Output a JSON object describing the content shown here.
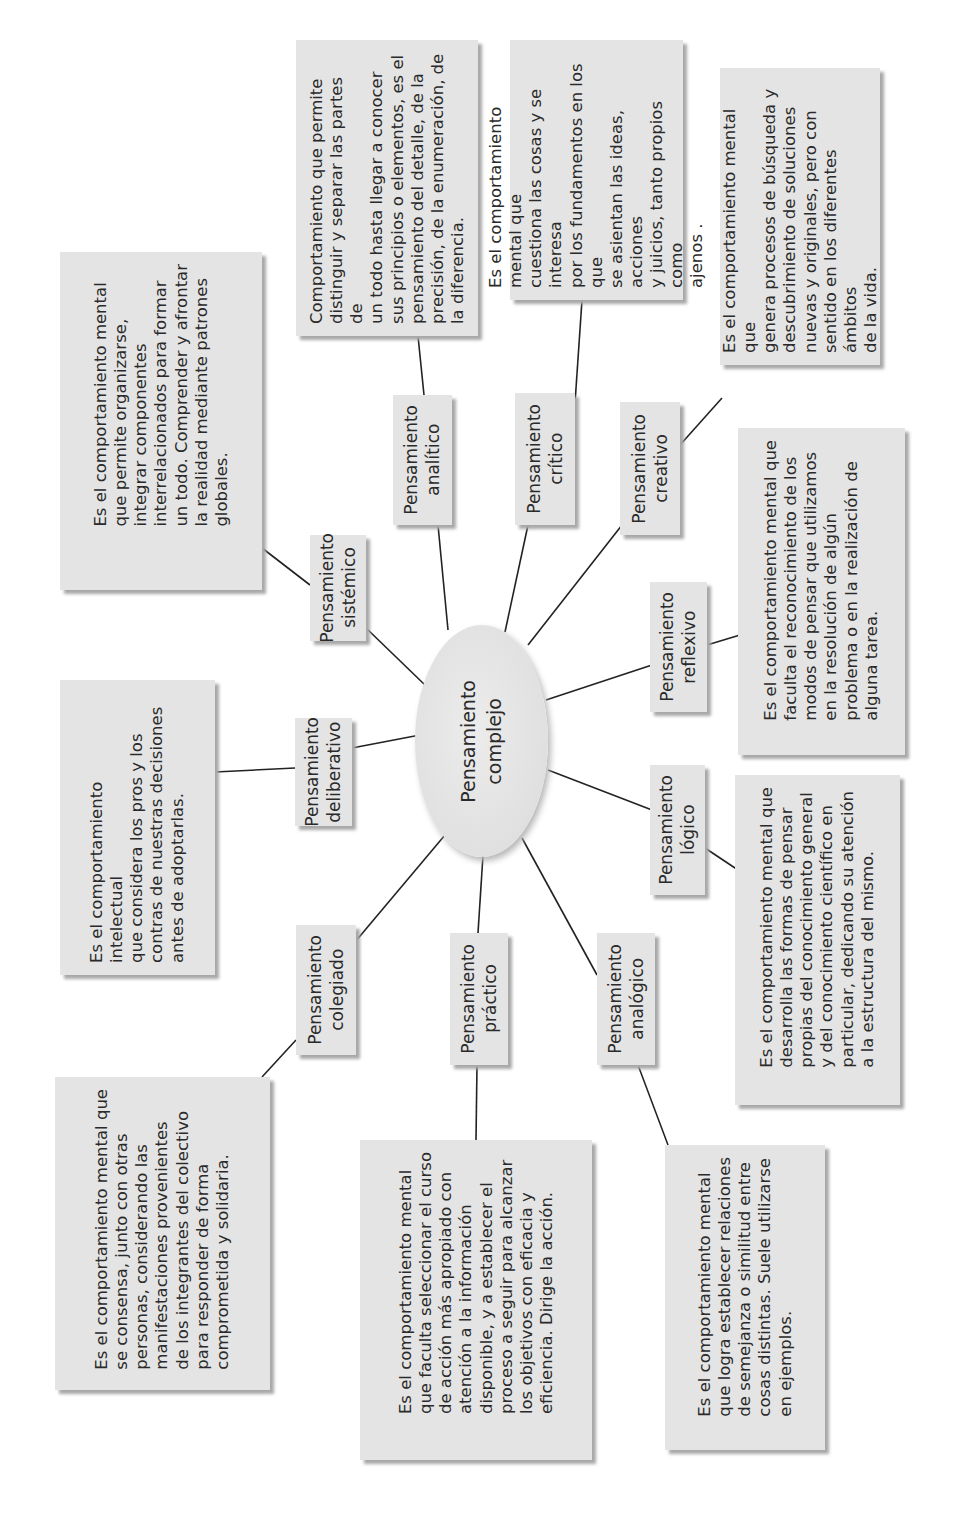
{
  "center": {
    "label": "Pensamiento\ncomplejo"
  },
  "colors": {
    "box_fill": "#e4e4e4",
    "shadow": "#a8a8a8",
    "line": "#222222",
    "text": "#2a2a2a"
  },
  "nodes": [
    {
      "id": "sistemico",
      "label": "Pensamiento\nsistémico",
      "definition": "Es el comportamiento mental\nque permite organizarse,\nintegrar componentes\ninterrelacionados para formar\nun todo. Comprender y afrontar\nla realidad mediante patrones\nglobales."
    },
    {
      "id": "analitico",
      "label": "Pensamiento\nanalítico",
      "definition": "Comportamiento que permite\ndistinguir y separar las partes de\nun todo hasta llegar a conocer\nsus principios o elementos, es el\npensamiento del detalle, de la\nprecisión, de la enumeración, de\nla diferencia."
    },
    {
      "id": "critico",
      "label": "Pensamiento\ncrítico",
      "definition": "Es el comportamiento mental que\ncuestiona las cosas y se interesa\npor los fundamentos en los que\nse asientan las ideas, acciones\ny juicios, tanto propios como\najenos ."
    },
    {
      "id": "creativo",
      "label": "Pensamiento\ncreativo",
      "definition": "Es el comportamiento mental que\ngenera procesos de búsqueda y\ndescubrimiento de soluciones\nnuevas y originales, pero con\nsentido en los diferentes ámbitos\nde la vida."
    },
    {
      "id": "reflexivo",
      "label": "Pensamiento\nreflexivo",
      "definition": "Es el comportamiento mental que\nfaculta el reconocimiento de los\nmodos  de pensar que utilizamos\nen la resolución de algún\nproblema o en la realización de\nalguna tarea."
    },
    {
      "id": "logico",
      "label": "Pensamiento\nlógico",
      "definition": "Es el comportamiento mental que\ndesarrolla las formas de pensar\npropias del conocimiento general\ny del conocimiento científico en\nparticular, dedicando su atención\na la estructura del mismo."
    },
    {
      "id": "analogico",
      "label": "Pensamiento\nanalógico",
      "definition": "Es el comportamiento mental\nque logra establecer relaciones\nde semejanza o similitud entre\ncosas distintas. Suele utilizarse\nen ejemplos."
    },
    {
      "id": "practico",
      "label": "Pensamiento\npráctico",
      "definition": "Es el comportamiento mental\nque faculta seleccionar el curso\nde acción más apropiado con\natención a la información\ndisponible, y a establecer el\nproceso a seguir para alcanzar\nlos objetivos con eficacia y\neficiencia. Dirige la acción."
    },
    {
      "id": "colegiado",
      "label": "Pensamiento\ncolegiado",
      "definition": "Es el comportamiento mental que\nse consensa, junto con otras\npersonas, considerando las\nmanifestaciones provenientes\nde los integrantes del colectivo\npara responder de forma\ncomprometida y solidaria."
    },
    {
      "id": "deliberativo",
      "label": "Pensamiento\ndeliberativo",
      "definition": "Es el comportamiento intelectual\nque considera los pros y los\ncontras de nuestras decisiones\nantes de adoptarlas."
    }
  ]
}
